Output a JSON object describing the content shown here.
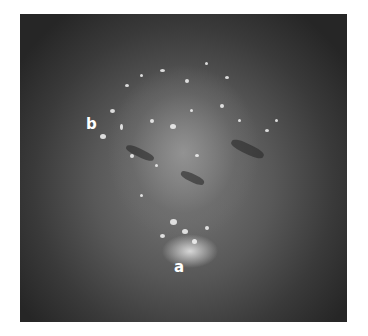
{
  "figure": {
    "labels": [
      {
        "text": "b",
        "x": 86,
        "y": 117
      },
      {
        "text": "a",
        "x": 174,
        "y": 260
      }
    ],
    "colors": {
      "background": "#ffffff",
      "label": "#ffffff",
      "photo_dark": "#262626",
      "photo_mid": "#7a7a7a",
      "highlight": "#ebebeb"
    }
  }
}
